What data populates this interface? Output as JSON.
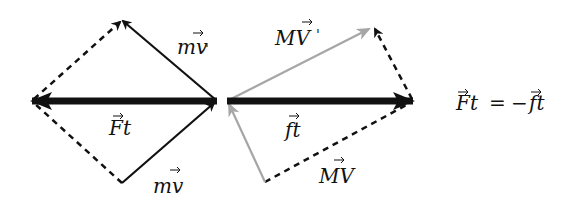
{
  "diagram": {
    "colors": {
      "black": "#111111",
      "gray": "#a6a6a6",
      "background": "#ffffff"
    },
    "left_group": {
      "label_mv_prime": "mv⃗'",
      "label_mv": "mv⃗",
      "label_Ft": "F⃗t",
      "label_mv_prime_base": "mv",
      "label_mv_prime_suffix": "'",
      "label_mv_base": "mv",
      "label_Ft_base": "Ft"
    },
    "right_group": {
      "label_MV_prime_base": "MV",
      "label_MV_prime_suffix": "'",
      "label_MV_base": "MV",
      "label_ft_base": "ft"
    },
    "equation": {
      "lhs": "Ft",
      "equals": "=",
      "minus": "−",
      "rhs": "ft"
    }
  }
}
